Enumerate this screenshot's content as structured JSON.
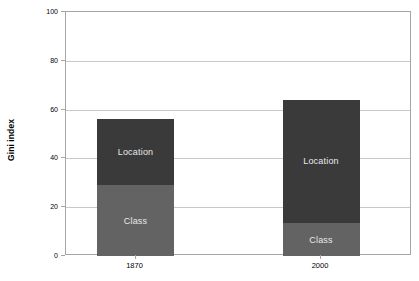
{
  "chart_data": {
    "type": "bar",
    "subtype": "stacked",
    "title": "",
    "xlabel": "",
    "ylabel": "Gini index",
    "categories": [
      "1870",
      "2000"
    ],
    "ylim": [
      0,
      100
    ],
    "yticks": [
      0,
      20,
      40,
      60,
      80,
      100
    ],
    "ytick_labels": [
      "0",
      "20",
      "40",
      "60",
      "80",
      "100"
    ],
    "grid": true,
    "legend": "none",
    "series": [
      {
        "name": "Class",
        "values": [
          29,
          13.5
        ],
        "color": "#636363",
        "label_in_bar": "Class"
      },
      {
        "name": "Location",
        "values": [
          27,
          50.5
        ],
        "color": "#3a3a3a",
        "label_in_bar": "Location"
      }
    ],
    "totals": [
      56,
      64
    ],
    "annotations": [
      {
        "text": "Location",
        "category": "1870",
        "series": "Location"
      },
      {
        "text": "Class",
        "category": "1870",
        "series": "Class"
      },
      {
        "text": "Location",
        "category": "2000",
        "series": "Location"
      },
      {
        "text": "Class",
        "category": "2000",
        "series": "Class"
      }
    ]
  },
  "colors": {
    "location": "#3a3a3a",
    "class": "#636363",
    "gridline": "#c8c8c8",
    "axis": "#a6a6a6",
    "background": "#ffffff",
    "text": "#000000",
    "bar_label_text": "#e9e9e9"
  }
}
